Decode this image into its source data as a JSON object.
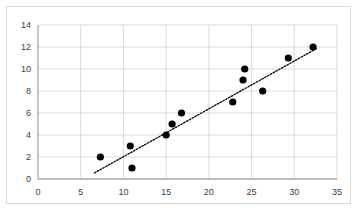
{
  "chart_data": {
    "type": "scatter",
    "title": "",
    "subtitle": "",
    "xlabel": "",
    "ylabel": "",
    "xlim": [
      0,
      35
    ],
    "ylim": [
      0,
      14
    ],
    "xticks": [
      0,
      5,
      10,
      15,
      20,
      25,
      30,
      35
    ],
    "yticks": [
      0,
      2,
      4,
      6,
      8,
      10,
      12,
      14
    ],
    "grid": "horizontal-and-vertical",
    "legend": "none",
    "series": [
      {
        "name": "observations",
        "marker": "filled-circle",
        "color": "#000000",
        "points": [
          {
            "x": 7.3,
            "y": 2
          },
          {
            "x": 10.8,
            "y": 3
          },
          {
            "x": 11.0,
            "y": 1
          },
          {
            "x": 15.0,
            "y": 4
          },
          {
            "x": 15.7,
            "y": 5
          },
          {
            "x": 16.8,
            "y": 6
          },
          {
            "x": 22.8,
            "y": 7
          },
          {
            "x": 24.0,
            "y": 9
          },
          {
            "x": 24.2,
            "y": 10
          },
          {
            "x": 26.3,
            "y": 8
          },
          {
            "x": 29.3,
            "y": 11
          },
          {
            "x": 32.2,
            "y": 12
          }
        ]
      }
    ],
    "trendline": {
      "name": "linear-fit",
      "style": "dotted",
      "color": "#000000",
      "x_start": 6.6,
      "y_start": 0.55,
      "x_end": 32.7,
      "y_end": 11.9
    },
    "axis_color": "#8c8c8c",
    "grid_color": "#d0d0d0",
    "tick_label_color": "#404040",
    "frame_color": "#d8d8d8",
    "background": "#ffffff"
  }
}
